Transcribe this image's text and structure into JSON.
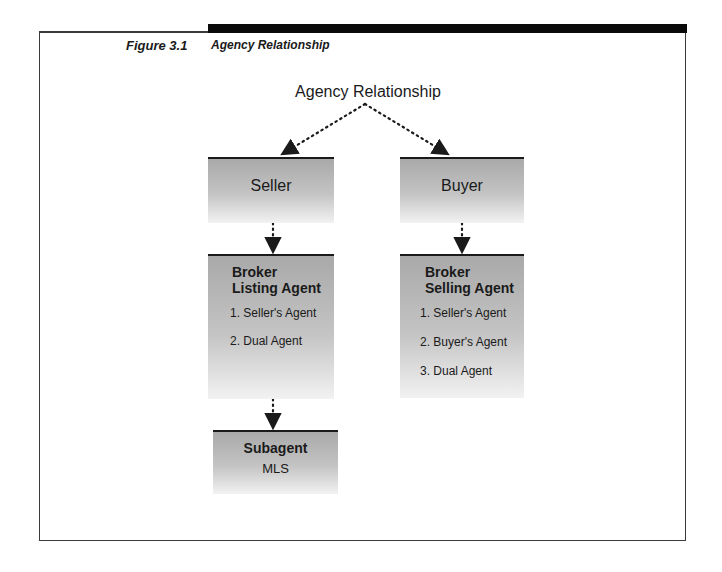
{
  "figure": {
    "number": "Figure 3.1",
    "title": "Agency Relationship"
  },
  "diagram": {
    "root": "Agency Relationship",
    "nodes": {
      "seller": {
        "label": "Seller"
      },
      "buyer": {
        "label": "Buyer"
      },
      "listing_broker": {
        "heading_line1": "Broker",
        "heading_line2": "Listing Agent",
        "items": [
          "1. Seller's Agent",
          "2. Dual Agent"
        ]
      },
      "selling_broker": {
        "heading_line1": "Broker",
        "heading_line2": "Selling Agent",
        "items": [
          "1. Seller's Agent",
          "2. Buyer's Agent",
          "3. Dual Agent"
        ]
      },
      "subagent": {
        "heading": "Subagent",
        "sub": "MLS"
      }
    },
    "edges": [
      [
        "Agency Relationship",
        "Seller"
      ],
      [
        "Agency Relationship",
        "Buyer"
      ],
      [
        "Seller",
        "Broker Listing Agent"
      ],
      [
        "Buyer",
        "Broker Selling Agent"
      ],
      [
        "Broker Listing Agent",
        "Subagent"
      ]
    ]
  }
}
